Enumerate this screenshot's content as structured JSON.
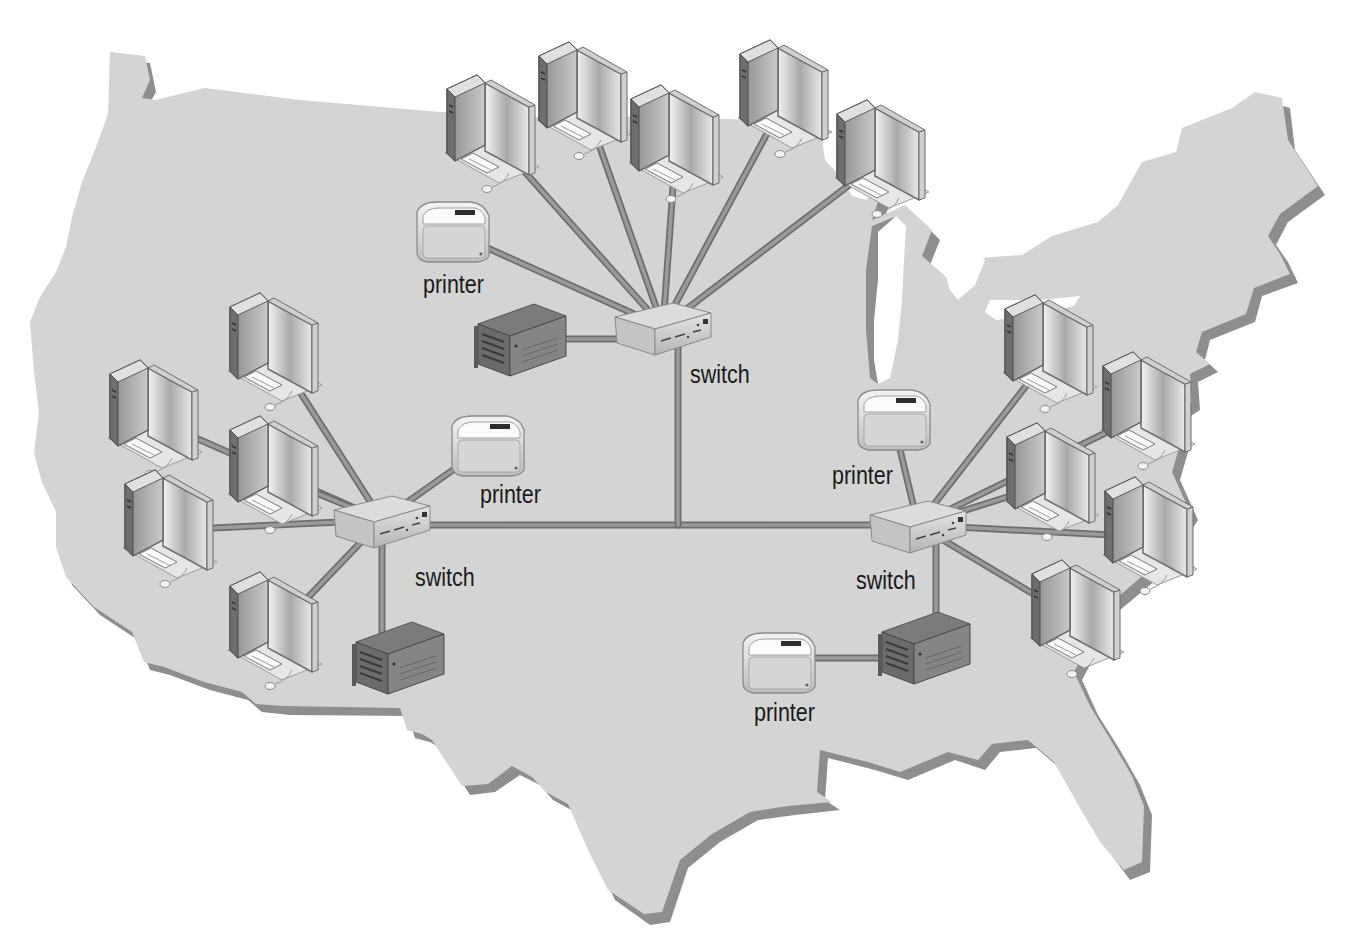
{
  "diagram": {
    "type": "network-topology",
    "background": "map of contiguous United States",
    "colors": {
      "map_fill": "#d4d4d4",
      "map_shadow": "#8e8e8e",
      "cable": "#9a9a9a",
      "cable_edge": "#6e6e6e",
      "text": "#1a1a1a"
    },
    "nodes": [
      {
        "id": "sw_center",
        "kind": "switch",
        "label": "switch",
        "x": 663,
        "y": 327,
        "label_x": 690,
        "label_y": 360
      },
      {
        "id": "sw_west",
        "kind": "switch",
        "label": "switch",
        "x": 382,
        "y": 520,
        "label_x": 415,
        "label_y": 563
      },
      {
        "id": "sw_east",
        "kind": "switch",
        "label": "switch",
        "x": 918,
        "y": 525,
        "label_x": 856,
        "label_y": 566
      },
      {
        "id": "pr_center",
        "kind": "printer",
        "label": "printer",
        "x": 452,
        "y": 232,
        "label_x": 423,
        "label_y": 270
      },
      {
        "id": "pr_west",
        "kind": "printer",
        "label": "printer",
        "x": 487,
        "y": 446,
        "label_x": 480,
        "label_y": 480
      },
      {
        "id": "pr_east",
        "kind": "printer",
        "label": "printer",
        "x": 893,
        "y": 420,
        "label_x": 832,
        "label_y": 461
      },
      {
        "id": "pr_south",
        "kind": "printer",
        "label": "printer",
        "x": 778,
        "y": 663,
        "label_x": 754,
        "label_y": 698
      },
      {
        "id": "srv_center",
        "kind": "server",
        "label": "",
        "x": 520,
        "y": 340
      },
      {
        "id": "srv_west",
        "kind": "server",
        "label": "",
        "x": 398,
        "y": 658
      },
      {
        "id": "srv_east",
        "kind": "server",
        "label": "",
        "x": 924,
        "y": 648
      },
      {
        "id": "pc_c1",
        "kind": "workstation",
        "label": "",
        "x": 492,
        "y": 135
      },
      {
        "id": "pc_c2",
        "kind": "workstation",
        "label": "",
        "x": 584,
        "y": 102
      },
      {
        "id": "pc_c3",
        "kind": "workstation",
        "label": "",
        "x": 676,
        "y": 145
      },
      {
        "id": "pc_c4",
        "kind": "workstation",
        "label": "",
        "x": 785,
        "y": 100
      },
      {
        "id": "pc_c5",
        "kind": "workstation",
        "label": "",
        "x": 882,
        "y": 160
      },
      {
        "id": "pc_w1",
        "kind": "workstation",
        "label": "",
        "x": 275,
        "y": 353
      },
      {
        "id": "pc_w2",
        "kind": "workstation",
        "label": "",
        "x": 155,
        "y": 420
      },
      {
        "id": "pc_w3",
        "kind": "workstation",
        "label": "",
        "x": 275,
        "y": 476
      },
      {
        "id": "pc_w4",
        "kind": "workstation",
        "label": "",
        "x": 170,
        "y": 530
      },
      {
        "id": "pc_w5",
        "kind": "workstation",
        "label": "",
        "x": 275,
        "y": 632
      },
      {
        "id": "pc_e1",
        "kind": "workstation",
        "label": "",
        "x": 1050,
        "y": 355
      },
      {
        "id": "pc_e2",
        "kind": "workstation",
        "label": "",
        "x": 1148,
        "y": 412
      },
      {
        "id": "pc_e3",
        "kind": "workstation",
        "label": "",
        "x": 1052,
        "y": 483
      },
      {
        "id": "pc_e4",
        "kind": "workstation",
        "label": "",
        "x": 1150,
        "y": 537
      },
      {
        "id": "pc_e5",
        "kind": "workstation",
        "label": "",
        "x": 1077,
        "y": 620
      }
    ],
    "links": [
      [
        "sw_center",
        "pc_c1"
      ],
      [
        "sw_center",
        "pc_c2"
      ],
      [
        "sw_center",
        "pc_c3"
      ],
      [
        "sw_center",
        "pc_c4"
      ],
      [
        "sw_center",
        "pc_c5"
      ],
      [
        "sw_center",
        "pr_center"
      ],
      [
        "sw_center",
        "srv_center"
      ],
      [
        "sw_west",
        "pc_w1"
      ],
      [
        "sw_west",
        "pc_w2"
      ],
      [
        "sw_west",
        "pc_w3"
      ],
      [
        "sw_west",
        "pc_w4"
      ],
      [
        "sw_west",
        "pc_w5"
      ],
      [
        "sw_west",
        "pr_west"
      ],
      [
        "sw_west",
        "srv_west"
      ],
      [
        "sw_east",
        "pc_e1"
      ],
      [
        "sw_east",
        "pc_e2"
      ],
      [
        "sw_east",
        "pc_e3"
      ],
      [
        "sw_east",
        "pc_e4"
      ],
      [
        "sw_east",
        "pc_e5"
      ],
      [
        "sw_east",
        "pr_east"
      ],
      [
        "sw_east",
        "srv_east"
      ],
      [
        "srv_east",
        "pr_south"
      ]
    ],
    "backbone": {
      "horizontal": {
        "from": "sw_west",
        "to": "sw_east",
        "y": 525
      },
      "vertical": {
        "from": "sw_center",
        "x": 678,
        "to_y": 525
      }
    },
    "counts": {
      "switches": 3,
      "printers": 4,
      "servers": 3,
      "workstations": 15
    }
  }
}
